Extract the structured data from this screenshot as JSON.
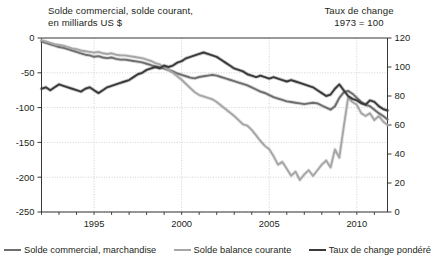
{
  "titles": {
    "left": "Solde commercial, solde courant,\nen milliards US $",
    "right": "Taux de change\n1973 = 100"
  },
  "legend": {
    "items": [
      {
        "label": "Solde commercial, marchandise",
        "color": "#6e6e6e"
      },
      {
        "label": "Solde balance courante",
        "color": "#a6a6a6"
      },
      {
        "label": "Taux de change pondéré",
        "color": "#3a3a3a"
      }
    ]
  },
  "axes": {
    "x": {
      "ticks": [
        "1995",
        "2000",
        "2005",
        "2010"
      ],
      "tick_values": [
        1995,
        2000,
        2005,
        2010
      ],
      "min": 1992.0,
      "max": 2011.75,
      "minor_step": 1
    },
    "y_left": {
      "ticks": [
        "0",
        "-50",
        "-100",
        "-150",
        "-200",
        "-250"
      ],
      "tick_values": [
        0,
        -50,
        -100,
        -150,
        -200,
        -250
      ],
      "min": -250,
      "max": 0
    },
    "y_right": {
      "ticks": [
        "120",
        "100",
        "80",
        "60",
        "40",
        "20",
        "0"
      ],
      "tick_values": [
        120,
        100,
        80,
        60,
        40,
        20,
        0
      ],
      "min": 0,
      "max": 120
    }
  },
  "chart_data": {
    "type": "line",
    "xlabel": "",
    "ylabel": "en milliards US $",
    "ylabel_right": "1973 = 100",
    "xlim": [
      1992.0,
      2011.75
    ],
    "ylim": [
      -250,
      0
    ],
    "ylim_right": [
      0,
      120
    ],
    "grid": true,
    "legend_position": "bottom",
    "series": [
      {
        "name": "Solde commercial, marchandise",
        "color": "#6e6e6e",
        "axis": "left",
        "x": [
          1992.0,
          1992.25,
          1992.5,
          1992.75,
          1993.0,
          1993.25,
          1993.5,
          1993.75,
          1994.0,
          1994.25,
          1994.5,
          1994.75,
          1995.0,
          1995.25,
          1995.5,
          1995.75,
          1996.0,
          1996.25,
          1996.5,
          1996.75,
          1997.0,
          1997.25,
          1997.5,
          1997.75,
          1998.0,
          1998.25,
          1998.5,
          1998.75,
          1999.0,
          1999.25,
          1999.5,
          1999.75,
          2000.0,
          2000.25,
          2000.5,
          2000.75,
          2001.0,
          2001.25,
          2001.5,
          2001.75,
          2002.0,
          2002.25,
          2002.5,
          2002.75,
          2003.0,
          2003.25,
          2003.5,
          2003.75,
          2004.0,
          2004.25,
          2004.5,
          2004.75,
          2005.0,
          2005.25,
          2005.5,
          2005.75,
          2006.0,
          2006.25,
          2006.5,
          2006.75,
          2007.0,
          2007.25,
          2007.5,
          2007.75,
          2008.0,
          2008.25,
          2008.5,
          2008.75,
          2009.0,
          2009.25,
          2009.5,
          2009.75,
          2010.0,
          2010.25,
          2010.5,
          2010.75,
          2011.0,
          2011.25,
          2011.5,
          2011.75
        ],
        "y": [
          -5,
          -7,
          -9,
          -11,
          -13,
          -14,
          -16,
          -18,
          -20,
          -22,
          -24,
          -25,
          -27,
          -26,
          -28,
          -29,
          -28,
          -30,
          -31,
          -31,
          -32,
          -33,
          -34,
          -35,
          -37,
          -39,
          -41,
          -42,
          -44,
          -46,
          -48,
          -51,
          -53,
          -55,
          -57,
          -58,
          -56,
          -55,
          -54,
          -53,
          -54,
          -56,
          -58,
          -60,
          -62,
          -64,
          -66,
          -68,
          -71,
          -74,
          -77,
          -79,
          -82,
          -85,
          -87,
          -89,
          -91,
          -92,
          -93,
          -94,
          -95,
          -94,
          -93,
          -94,
          -97,
          -100,
          -103,
          -98,
          -86,
          -78,
          -76,
          -80,
          -86,
          -92,
          -96,
          -98,
          -103,
          -108,
          -112,
          -117
        ]
      },
      {
        "name": "Solde balance courante",
        "color": "#a6a6a6",
        "axis": "left",
        "x": [
          1992.0,
          1992.25,
          1992.5,
          1992.75,
          1993.0,
          1993.25,
          1993.5,
          1993.75,
          1994.0,
          1994.25,
          1994.5,
          1994.75,
          1995.0,
          1995.25,
          1995.5,
          1995.75,
          1996.0,
          1996.25,
          1996.5,
          1996.75,
          1997.0,
          1997.25,
          1997.5,
          1997.75,
          1998.0,
          1998.25,
          1998.5,
          1998.75,
          1999.0,
          1999.25,
          1999.5,
          1999.75,
          2000.0,
          2000.25,
          2000.5,
          2000.75,
          2001.0,
          2001.25,
          2001.5,
          2001.75,
          2002.0,
          2002.25,
          2002.5,
          2002.75,
          2003.0,
          2003.25,
          2003.5,
          2003.75,
          2004.0,
          2004.25,
          2004.5,
          2004.75,
          2005.0,
          2005.25,
          2005.5,
          2005.75,
          2006.0,
          2006.25,
          2006.5,
          2006.75,
          2007.0,
          2007.25,
          2007.5,
          2007.75,
          2008.0,
          2008.25,
          2008.5,
          2008.75,
          2009.0,
          2009.25,
          2009.5,
          2009.75,
          2010.0,
          2010.25,
          2010.5,
          2010.75,
          2011.0,
          2011.25,
          2011.5,
          2011.75
        ],
        "y": [
          -3,
          -5,
          -7,
          -9,
          -10,
          -11,
          -13,
          -15,
          -16,
          -18,
          -19,
          -20,
          -21,
          -20,
          -22,
          -23,
          -22,
          -24,
          -25,
          -25,
          -26,
          -27,
          -28,
          -29,
          -31,
          -33,
          -36,
          -38,
          -42,
          -46,
          -50,
          -55,
          -60,
          -66,
          -72,
          -78,
          -82,
          -84,
          -86,
          -88,
          -92,
          -97,
          -102,
          -107,
          -112,
          -118,
          -124,
          -126,
          -132,
          -140,
          -148,
          -155,
          -160,
          -170,
          -182,
          -178,
          -188,
          -198,
          -192,
          -204,
          -196,
          -190,
          -198,
          -190,
          -182,
          -176,
          -186,
          -160,
          -172,
          -128,
          -86,
          -92,
          -96,
          -108,
          -112,
          -108,
          -118,
          -112,
          -120,
          -125
        ]
      },
      {
        "name": "Taux de change pondéré",
        "color": "#3a3a3a",
        "axis": "right",
        "x": [
          1992.0,
          1992.25,
          1992.5,
          1992.75,
          1993.0,
          1993.25,
          1993.5,
          1993.75,
          1994.0,
          1994.25,
          1994.5,
          1994.75,
          1995.0,
          1995.25,
          1995.5,
          1995.75,
          1996.0,
          1996.25,
          1996.5,
          1996.75,
          1997.0,
          1997.25,
          1997.5,
          1997.75,
          1998.0,
          1998.25,
          1998.5,
          1998.75,
          1999.0,
          1999.25,
          1999.5,
          1999.75,
          2000.0,
          2000.25,
          2000.5,
          2000.75,
          2001.0,
          2001.25,
          2001.5,
          2001.75,
          2002.0,
          2002.25,
          2002.5,
          2002.75,
          2003.0,
          2003.25,
          2003.5,
          2003.75,
          2004.0,
          2004.25,
          2004.5,
          2004.75,
          2005.0,
          2005.25,
          2005.5,
          2005.75,
          2006.0,
          2006.25,
          2006.5,
          2006.75,
          2007.0,
          2007.25,
          2007.5,
          2007.75,
          2008.0,
          2008.25,
          2008.5,
          2008.75,
          2009.0,
          2009.25,
          2009.5,
          2009.75,
          2010.0,
          2010.25,
          2010.5,
          2010.75,
          2011.0,
          2011.25,
          2011.5,
          2011.75
        ],
        "y": [
          85,
          86,
          84,
          86,
          88,
          87,
          86,
          85,
          84,
          83,
          85,
          86,
          84,
          82,
          84,
          86,
          87,
          88,
          89,
          90,
          91,
          93,
          95,
          96,
          98,
          99,
          100,
          99,
          101,
          100,
          101,
          103,
          104,
          106,
          107,
          108,
          109,
          110,
          109,
          108,
          107,
          105,
          103,
          101,
          99,
          98,
          97,
          95,
          94,
          93,
          94,
          93,
          92,
          93,
          92,
          91,
          90,
          91,
          90,
          89,
          88,
          87,
          86,
          84,
          82,
          80,
          81,
          85,
          88,
          84,
          80,
          78,
          77,
          75,
          74,
          77,
          76,
          73,
          71,
          70
        ]
      }
    ]
  }
}
